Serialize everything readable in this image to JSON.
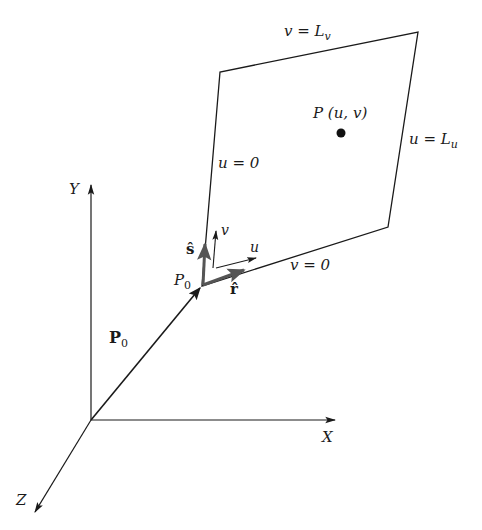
{
  "diagram": {
    "type": "3d-parametric-plane",
    "colors": {
      "line": "#1a1a1a",
      "vector": "#555555",
      "background": "#ffffff"
    },
    "axes": {
      "origin": [
        91,
        420
      ],
      "x": {
        "label": "X",
        "tip": [
          335,
          420
        ]
      },
      "y": {
        "label": "Y",
        "tip": [
          91,
          185
        ]
      },
      "z": {
        "label": "Z",
        "tip": [
          35,
          512
        ]
      }
    },
    "plane": {
      "corners": [
        [
          202,
          286
        ],
        [
          220,
          72
        ],
        [
          418,
          32
        ],
        [
          388,
          227
        ]
      ],
      "edge_labels": {
        "top": "v = L",
        "top_sub": "v",
        "right": "u = L",
        "right_sub": "u",
        "left": "u = 0",
        "bottom": "v = 0"
      }
    },
    "point": {
      "label": "P (u, v)",
      "position": [
        341,
        133
      ]
    },
    "origin_point": {
      "label": "P",
      "sub": "0",
      "position": [
        202,
        286
      ]
    },
    "vectors": {
      "P0": {
        "label": "P",
        "sub": "0",
        "from": [
          91,
          420
        ],
        "to": [
          200,
          288
        ]
      },
      "s_hat": {
        "label": "ŝ",
        "from": [
          203,
          285
        ],
        "to": [
          205,
          244
        ]
      },
      "r_hat": {
        "label": "r̂",
        "from": [
          203,
          285
        ],
        "to": [
          244,
          270
        ]
      },
      "v_dir": {
        "label": "v",
        "from": [
          213,
          268
        ],
        "to": [
          216,
          231
        ]
      },
      "u_dir": {
        "label": "u",
        "from": [
          216,
          268
        ],
        "to": [
          256,
          258
        ]
      }
    }
  }
}
